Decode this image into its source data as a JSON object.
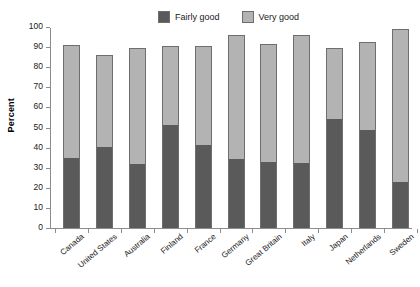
{
  "chart_data": {
    "type": "bar",
    "subtype": "stacked-vertical",
    "title": "",
    "xlabel": "",
    "ylabel": "Percent",
    "ylim": [
      0,
      100
    ],
    "ytick_values": [
      0,
      10,
      20,
      30,
      40,
      50,
      60,
      70,
      80,
      90,
      100
    ],
    "ytick_labels": [
      "0",
      "10",
      "20",
      "30",
      "40",
      "50",
      "60",
      "70",
      "80",
      "90",
      "100"
    ],
    "grid": false,
    "legend_position": "top-center",
    "categories": [
      "Canada",
      "United States",
      "Australia",
      "Finland",
      "France",
      "Germany",
      "Great Britain",
      "Italy",
      "Japan",
      "Netherlands",
      "Sweden"
    ],
    "series": [
      {
        "name": "Fairly good",
        "color": "#5a5a5a",
        "values": [
          35,
          40.5,
          32,
          51.5,
          41.5,
          34.5,
          33,
          32.5,
          54,
          49,
          23
        ]
      },
      {
        "name": "Very good",
        "color": "#b3b3b3",
        "values": [
          56,
          45.5,
          57.5,
          39,
          49,
          61.5,
          58.5,
          63.5,
          35.5,
          43.5,
          76
        ]
      }
    ],
    "totals": [
      91,
      86,
      89.5,
      90.5,
      90.5,
      96,
      91.5,
      96,
      89.5,
      92.5,
      99
    ]
  },
  "legend": {
    "entries": [
      {
        "label": "Fairly good",
        "color": "#5a5a5a"
      },
      {
        "label": "Very good",
        "color": "#b3b3b3"
      }
    ]
  },
  "colors": {
    "fairly_good": "#5a5a5a",
    "very_good": "#b3b3b3",
    "axis": "#8c8c8c",
    "bar_outline": "#6e6e6e",
    "background": "#ffffff",
    "text": "#1a1a1a"
  }
}
